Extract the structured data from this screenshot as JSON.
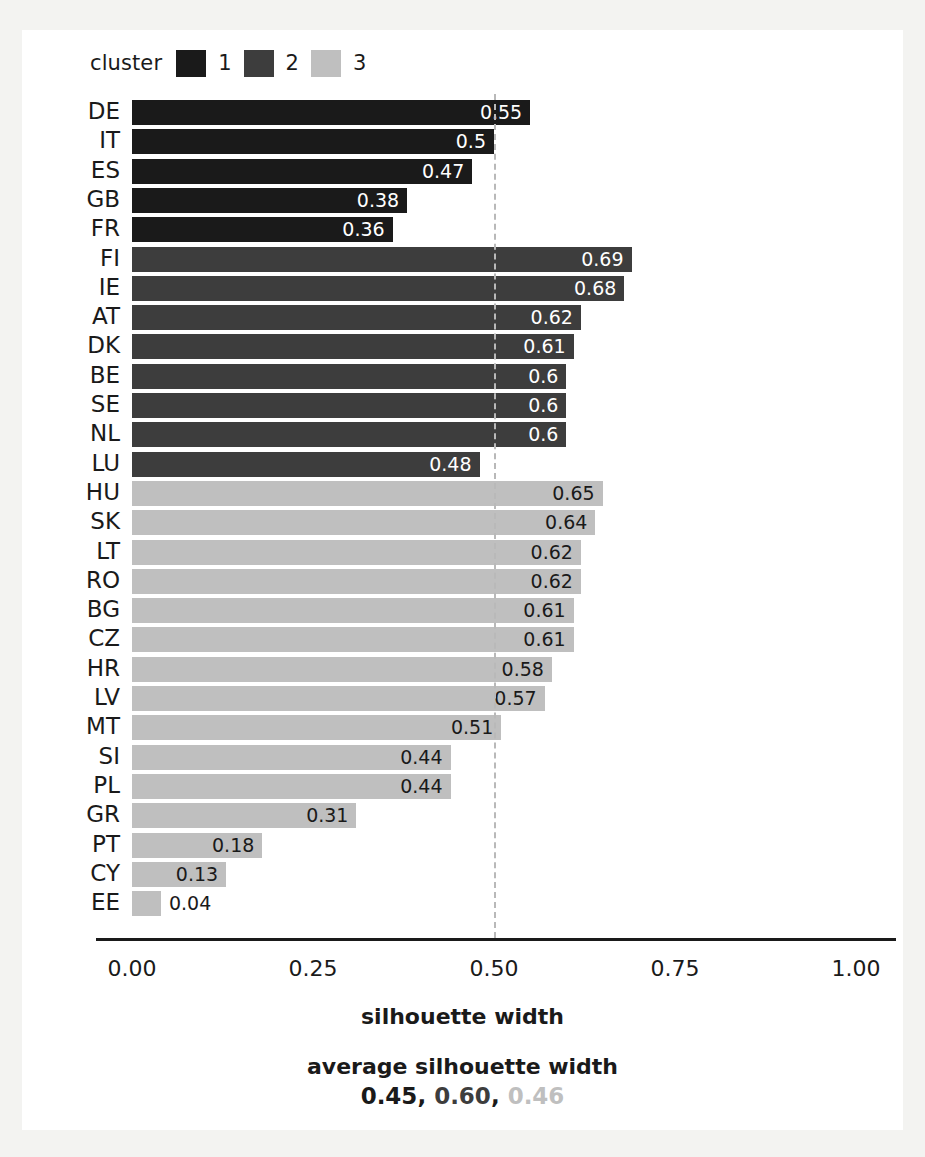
{
  "legend": {
    "title": "cluster",
    "entries": [
      {
        "label": "1",
        "color": "#1a1a1a"
      },
      {
        "label": "2",
        "color": "#3d3d3d"
      },
      {
        "label": "3",
        "color": "#bfbfbf"
      }
    ]
  },
  "axis": {
    "x_label": "silhouette width",
    "ticks": [
      "0.00",
      "0.25",
      "0.50",
      "0.75",
      "1.00"
    ],
    "tick_values": [
      0.0,
      0.25,
      0.5,
      0.75,
      1.0
    ],
    "xlim": [
      0.0,
      1.0
    ]
  },
  "reference_line": {
    "value": 0.5,
    "style": "dashed",
    "color": "#b9b9b9"
  },
  "footer": {
    "title": "average silhouette width",
    "values": [
      "0.45",
      "0.60",
      "0.46"
    ],
    "colors": [
      "#1a1a1a",
      "#3d3d3d",
      "#bfbfbf"
    ],
    "separator": ", "
  },
  "chart_data": {
    "type": "bar",
    "orientation": "horizontal",
    "title": "",
    "xlabel": "silhouette width",
    "ylabel": "",
    "xlim": [
      0.0,
      1.0
    ],
    "grid": false,
    "legend_position": "top-left",
    "legend_title": "cluster",
    "categories": [
      "DE",
      "IT",
      "ES",
      "GB",
      "FR",
      "FI",
      "IE",
      "AT",
      "DK",
      "BE",
      "SE",
      "NL",
      "LU",
      "HU",
      "SK",
      "LT",
      "RO",
      "BG",
      "CZ",
      "HR",
      "LV",
      "MT",
      "SI",
      "PL",
      "GR",
      "PT",
      "CY",
      "EE"
    ],
    "values": [
      0.55,
      0.5,
      0.47,
      0.38,
      0.36,
      0.69,
      0.68,
      0.62,
      0.61,
      0.6,
      0.6,
      0.6,
      0.48,
      0.65,
      0.64,
      0.62,
      0.62,
      0.61,
      0.61,
      0.58,
      0.57,
      0.51,
      0.44,
      0.44,
      0.31,
      0.18,
      0.13,
      0.04
    ],
    "value_labels": [
      "0.55",
      "0.5",
      "0.47",
      "0.38",
      "0.36",
      "0.69",
      "0.68",
      "0.62",
      "0.61",
      "0.6",
      "0.6",
      "0.6",
      "0.48",
      "0.65",
      "0.64",
      "0.62",
      "0.62",
      "0.61",
      "0.61",
      "0.58",
      "0.57",
      "0.51",
      "0.44",
      "0.44",
      "0.31",
      "0.18",
      "0.13",
      "0.04"
    ],
    "cluster": [
      1,
      1,
      1,
      1,
      1,
      2,
      2,
      2,
      2,
      2,
      2,
      2,
      2,
      3,
      3,
      3,
      3,
      3,
      3,
      3,
      3,
      3,
      3,
      3,
      3,
      3,
      3,
      3
    ],
    "cluster_colors": {
      "1": "#1a1a1a",
      "2": "#3d3d3d",
      "3": "#bfbfbf"
    },
    "annotations": {
      "reference_line_x": 0.5
    },
    "average_silhouette_width": {
      "1": 0.45,
      "2": 0.6,
      "3": 0.46
    }
  }
}
